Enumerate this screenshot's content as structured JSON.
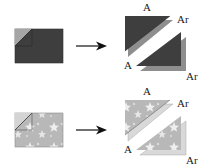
{
  "colors": {
    "dark_fabric": "#3e3e3e",
    "dark_fold": "#a6a6a6",
    "reverse_gray": "#8e8e8e",
    "light_fabric": "#b8b8b8",
    "light_fold": "#d4d4d4",
    "reverse_light": "#d9d9d9",
    "star": "#eeeeee",
    "arrow": "#111111"
  },
  "rows": [
    {
      "name": "solid-fabric",
      "upper": {
        "front_label": "A",
        "back_label": "Ar"
      },
      "lower": {
        "front_label": "A",
        "back_label": "Ar"
      }
    },
    {
      "name": "star-print-fabric",
      "upper": {
        "front_label": "A",
        "back_label": "Ar"
      },
      "lower": {
        "front_label": "A",
        "back_label": "Ar"
      }
    }
  ]
}
